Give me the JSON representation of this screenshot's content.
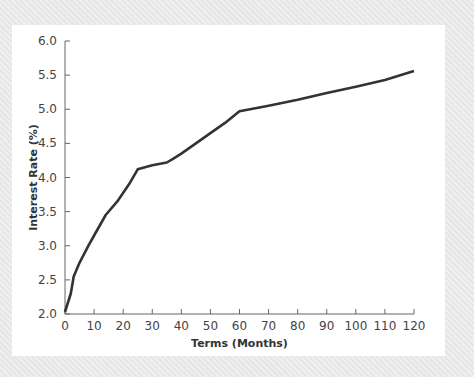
{
  "chart_data": {
    "type": "line",
    "title": "",
    "xlabel": "Terms (Months)",
    "ylabel": "Interest Rate (%)",
    "xlim": [
      0,
      120
    ],
    "ylim": [
      2.0,
      6.0
    ],
    "x_ticks": [
      0,
      10,
      20,
      30,
      40,
      50,
      60,
      70,
      80,
      90,
      100,
      110,
      120
    ],
    "y_ticks": [
      "2.0",
      "2.5",
      "3.0",
      "3.5",
      "4.0",
      "4.5",
      "5.0",
      "5.5",
      "6.0"
    ],
    "grid": false,
    "legend": null,
    "series": [
      {
        "name": "Yield curve",
        "color": "#333333",
        "x": [
          0,
          2,
          3,
          5,
          8,
          10,
          14,
          18,
          22,
          25,
          30,
          35,
          37,
          40,
          45,
          50,
          55,
          60,
          70,
          80,
          90,
          100,
          110,
          120
        ],
        "values": [
          2.03,
          2.3,
          2.55,
          2.75,
          3.0,
          3.15,
          3.45,
          3.65,
          3.9,
          4.12,
          4.18,
          4.22,
          4.27,
          4.35,
          4.5,
          4.65,
          4.8,
          4.97,
          5.05,
          5.14,
          5.24,
          5.33,
          5.43,
          5.56
        ]
      }
    ]
  }
}
